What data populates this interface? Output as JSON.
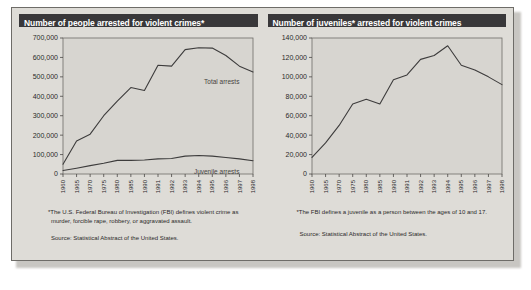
{
  "panel": {
    "accent_header_bg": "#39383a",
    "panel_bg": "#dedcd7",
    "plot_bg": "#d7d5d0",
    "line_color": "#3d3c3c"
  },
  "left_chart": {
    "title": "Number of people arrested for violent crimes*",
    "footnote": "*The U.S. Federal Bureau of Investigation (FBI) defines violent crime as murder, forcible rape, robbery, or aggravated assault.",
    "source": "Source: Statistical Abstract of the United States.",
    "series_label_total": "Total arrests",
    "series_label_juvenile": "Juvenile arrests"
  },
  "right_chart": {
    "title": "Number of juveniles* arrested for violent crimes",
    "footnote": "*The FBI defines a juvenile as a person between the ages of 10 and 17.",
    "source": "Source: Statistical Abstract of the United States."
  },
  "chart_data": [
    {
      "type": "line",
      "id": "people-arrested-violent-crimes",
      "title": "Number of people arrested for violent crimes*",
      "xlabel": "",
      "ylabel": "",
      "grid": false,
      "legend": "inline-right",
      "categories": [
        1960,
        1965,
        1970,
        1975,
        1980,
        1985,
        1990,
        1991,
        1992,
        1993,
        1994,
        1995,
        1996,
        1997,
        1998
      ],
      "xtick_labels": [
        "1960",
        "1965",
        "1970",
        "1975",
        "1980",
        "1985",
        "1990",
        "1991",
        "1992",
        "1993",
        "1994",
        "1995",
        "1996",
        "1997",
        "1998"
      ],
      "ytick_labels": [
        "0",
        "100,000",
        "200,000",
        "300,000",
        "400,000",
        "500,000",
        "600,000",
        "700,000"
      ],
      "ylim": [
        0,
        700000
      ],
      "ytick_values": [
        0,
        100000,
        200000,
        300000,
        400000,
        500000,
        600000,
        700000
      ],
      "series": [
        {
          "name": "Total arrests",
          "values": [
            50000,
            170000,
            205000,
            300000,
            375000,
            445000,
            430000,
            560000,
            555000,
            640000,
            650000,
            648000,
            610000,
            555000,
            525000
          ]
        },
        {
          "name": "Juvenile arrests",
          "values": [
            18000,
            30000,
            43000,
            55000,
            70000,
            70000,
            72000,
            78000,
            80000,
            92000,
            95000,
            92000,
            85000,
            78000,
            68000
          ]
        }
      ]
    },
    {
      "type": "line",
      "id": "juveniles-arrested-violent-crimes",
      "title": "Number of juveniles* arrested for violent crimes",
      "xlabel": "",
      "ylabel": "",
      "grid": false,
      "legend": "none",
      "categories": [
        1960,
        1965,
        1970,
        1975,
        1980,
        1985,
        1990,
        1991,
        1992,
        1993,
        1994,
        1995,
        1996,
        1997,
        1998
      ],
      "xtick_labels": [
        "1960",
        "1965",
        "1970",
        "1975",
        "1980",
        "1985",
        "1990",
        "1991",
        "1992",
        "1993",
        "1994",
        "1995",
        "1996",
        "1997",
        "1998"
      ],
      "ytick_labels": [
        "0",
        "20,000",
        "40,000",
        "60,000",
        "80,000",
        "100,000",
        "120,000",
        "140,000"
      ],
      "ylim": [
        0,
        140000
      ],
      "ytick_values": [
        0,
        20000,
        40000,
        60000,
        80000,
        100000,
        120000,
        140000
      ],
      "series": [
        {
          "name": "Juvenile arrests",
          "values": [
            17000,
            32000,
            50000,
            72000,
            77000,
            72000,
            97000,
            102000,
            118000,
            122000,
            132000,
            112000,
            107000,
            100000,
            92000
          ]
        }
      ]
    }
  ]
}
